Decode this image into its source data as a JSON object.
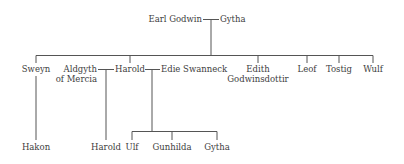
{
  "tree": {
    "root": {
      "father": "Earl Godwin",
      "mother": "Gytha"
    },
    "children": [
      {
        "name": "Sweyn"
      },
      {
        "name_line1": "Aldgyth",
        "name_line2": "of Mercia"
      },
      {
        "name": "Harold"
      },
      {
        "name": "Edie Swanneck"
      },
      {
        "name_line1": "Edith",
        "name_line2": "Godwinsdottir"
      },
      {
        "name": "Leof"
      },
      {
        "name": "Tostig"
      },
      {
        "name": "Wulf"
      }
    ],
    "grandchildren": [
      {
        "name": "Hakon",
        "parent": "Sweyn"
      },
      {
        "name": "Harold",
        "parent": "Harold & Aldgyth of Mercia"
      },
      {
        "name": "Ulf",
        "parent": "Harold & Edie Swanneck"
      },
      {
        "name": "Gunhilda",
        "parent": "Harold & Edie Swanneck"
      },
      {
        "name": "Gytha",
        "parent": "Harold & Edie Swanneck"
      }
    ]
  },
  "colors": {
    "line": "#555555",
    "text": "#3d3d3d"
  }
}
